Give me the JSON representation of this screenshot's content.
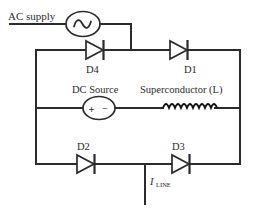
{
  "diagram": {
    "type": "circuit-schematic",
    "background_color": "#ffffff",
    "line_color": "#2b2b2b",
    "labels": {
      "ac_supply": "AC supply",
      "dc_source": "DC Source",
      "superconductor": "Superconductor (L)",
      "line_current": "I",
      "line_current_subscript": "LINE"
    },
    "sources": [
      {
        "name": "ac-source",
        "label": "AC supply",
        "symbol": "sine-wave-in-circle",
        "shape": "ellipse"
      },
      {
        "name": "dc-source",
        "label": "DC Source",
        "symbol": "plus-minus-in-circle",
        "shape": "ellipse",
        "plus": "+",
        "minus": "−"
      }
    ],
    "components": [
      {
        "name": "diode-d4",
        "label": "D4",
        "type": "diode",
        "direction": "right",
        "position": "top-left-branch"
      },
      {
        "name": "diode-d1",
        "label": "D1",
        "type": "diode",
        "direction": "right",
        "position": "top-right-branch"
      },
      {
        "name": "diode-d2",
        "label": "D2",
        "type": "diode",
        "direction": "right",
        "position": "bottom-left-branch"
      },
      {
        "name": "diode-d3",
        "label": "D3",
        "type": "diode",
        "direction": "right",
        "position": "bottom-right-branch"
      },
      {
        "name": "inductor-superconductor",
        "label": "Superconductor (L)",
        "type": "inductor-coil",
        "turns": 9,
        "position": "middle-right-branch"
      }
    ],
    "terminals": [
      {
        "name": "line-current-tap",
        "label": "I",
        "subscript": "LINE",
        "position": "bottom-center"
      }
    ]
  }
}
